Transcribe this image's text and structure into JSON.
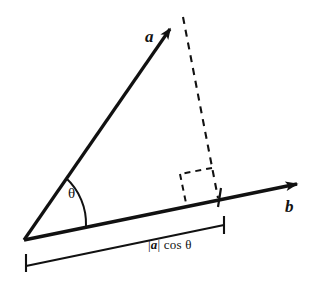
{
  "figure": {
    "background_color": "#ffffff",
    "stroke_color": "#111111",
    "width": 330,
    "height": 281
  },
  "labels": {
    "vector_a": "a",
    "vector_b": "b",
    "angle": "θ",
    "projection_magnitude": "|",
    "projection_vector_name": "a",
    "projection_tail": "| cos θ",
    "projection_full": "|a| cos θ"
  },
  "geometry": {
    "origin": {
      "x": 24,
      "y": 240
    },
    "vector_a_tip": {
      "x": 178,
      "y": 22
    },
    "vector_b_tip": {
      "x": 307,
      "y": 182
    },
    "foot_of_perpendicular": {
      "x": 218,
      "y": 197
    },
    "angle_arc_radius": 62,
    "right_angle_box_size": 30,
    "measure_bracket_start": {
      "x": 26,
      "y": 266
    },
    "measure_bracket_end": {
      "x": 224,
      "y": 225
    },
    "tick_half_length": 9
  },
  "elements": {
    "vector_a_name": "vector-a-arrow",
    "vector_b_name": "vector-b-arrow",
    "dashed_drop_name": "perpendicular-dashed-line",
    "right_angle_name": "right-angle-marker",
    "angle_arc_name": "angle-arc",
    "bracket_name": "projection-measure-bracket"
  }
}
